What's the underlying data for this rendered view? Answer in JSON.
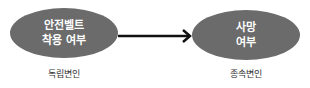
{
  "diagram": {
    "nodes": [
      {
        "id": "independent",
        "lines": [
          "안전벨트",
          "착용 여부"
        ],
        "caption": "독립변인"
      },
      {
        "id": "dependent",
        "lines": [
          "사망",
          "여부"
        ],
        "caption": "종속변인"
      }
    ],
    "edges": [
      {
        "from": "independent",
        "to": "dependent",
        "style": "arrow"
      }
    ],
    "colors": {
      "node_fill": "#6b6b6b",
      "node_text": "#ffffff",
      "arrow": "#111111",
      "caption_text": "#333333"
    }
  }
}
